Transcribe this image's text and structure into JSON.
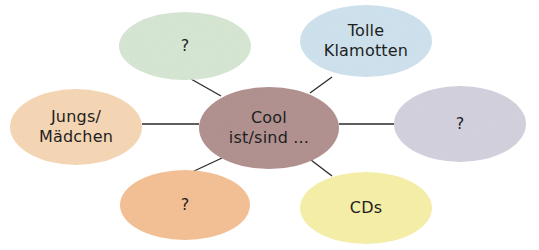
{
  "diagram": {
    "type": "mind-map",
    "center": {
      "lines": [
        "Cool",
        "ist/sind ..."
      ],
      "color": "#b39391",
      "cx": 269,
      "cy": 128,
      "rx": 70,
      "ry": 41
    },
    "nodes": [
      {
        "id": "top-left",
        "lines": [
          "?"
        ],
        "color": "#d7e7d4",
        "cx": 185,
        "cy": 46,
        "rx": 66,
        "ry": 34
      },
      {
        "id": "top-right",
        "lines": [
          "Tolle",
          "Klamotten"
        ],
        "color": "#cfe3ee",
        "cx": 366,
        "cy": 41,
        "rx": 66,
        "ry": 36
      },
      {
        "id": "left",
        "lines": [
          "Jungs/",
          "Mädchen"
        ],
        "color": "#f6d7b6",
        "cx": 76,
        "cy": 127,
        "rx": 66,
        "ry": 38
      },
      {
        "id": "right",
        "lines": [
          "?"
        ],
        "color": "#d3d2de",
        "cx": 460,
        "cy": 124,
        "rx": 66,
        "ry": 38
      },
      {
        "id": "bottom-left",
        "lines": [
          "?"
        ],
        "color": "#f5c196",
        "cx": 185,
        "cy": 205,
        "rx": 65,
        "ry": 35
      },
      {
        "id": "bottom-right",
        "lines": [
          "CDs"
        ],
        "color": "#f7f0a9",
        "cx": 366,
        "cy": 208,
        "rx": 66,
        "ry": 36
      }
    ],
    "connectors": [
      {
        "from": "center",
        "to": "top-left",
        "x1": 221,
        "y1": 96,
        "x2": 191,
        "y2": 79
      },
      {
        "from": "center",
        "to": "top-right",
        "x1": 310,
        "y1": 93,
        "x2": 332,
        "y2": 77
      },
      {
        "from": "center",
        "to": "left",
        "x1": 199,
        "y1": 124,
        "x2": 142,
        "y2": 124
      },
      {
        "from": "center",
        "to": "right",
        "x1": 339,
        "y1": 124,
        "x2": 394,
        "y2": 124
      },
      {
        "from": "center",
        "to": "bottom-left",
        "x1": 222,
        "y1": 158,
        "x2": 192,
        "y2": 172
      },
      {
        "from": "center",
        "to": "bottom-right",
        "x1": 311,
        "y1": 160,
        "x2": 332,
        "y2": 176
      }
    ]
  }
}
